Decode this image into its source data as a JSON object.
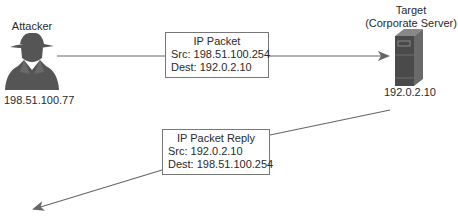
{
  "diagram": {
    "attacker": {
      "label": "Attacker",
      "ip": "198.51.100.77",
      "icon": "spy-silhouette-icon"
    },
    "target": {
      "label_line1": "Target",
      "label_line2": "(Corporate Server)",
      "ip": "192.0.2.10",
      "icon": "server-tower-icon"
    },
    "packet": {
      "title": "IP Packet",
      "src": "Src: 198.51.100.254",
      "dest": "Dest: 192.0.2.10"
    },
    "reply": {
      "title": "IP Packet Reply",
      "src": "Src: 192.0.2.10",
      "dest": "Dest: 198.51.100.254"
    },
    "colors": {
      "line": "#666666",
      "icon": "#555555",
      "server_front": "#444444",
      "server_side": "#666666"
    }
  }
}
